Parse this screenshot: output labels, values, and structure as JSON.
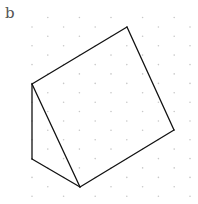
{
  "figure": {
    "label": "b"
  },
  "grid": {
    "dot_color": "#c8c8c8",
    "dot_radius": 0.8,
    "col_x0": 32,
    "col_dx": 15.8,
    "num_cols": 11,
    "even_col_y0": 27,
    "odd_col_y0": 17.5,
    "row_dy": 18.8,
    "y_max": 197
  },
  "shape": {
    "name": "triangular-prism",
    "stroke": "#111111",
    "stroke_width": 1.3,
    "vertices": {
      "top": [
        127,
        27
      ],
      "left": [
        32,
        84
      ],
      "right": [
        174,
        130
      ],
      "bottom_left": [
        32,
        159
      ],
      "bottom": [
        80,
        187
      ]
    },
    "edges": [
      [
        "left",
        "top"
      ],
      [
        "top",
        "right"
      ],
      [
        "right",
        "bottom"
      ],
      [
        "bottom",
        "left"
      ],
      [
        "left",
        "bottom_left"
      ],
      [
        "bottom_left",
        "bottom"
      ]
    ]
  }
}
